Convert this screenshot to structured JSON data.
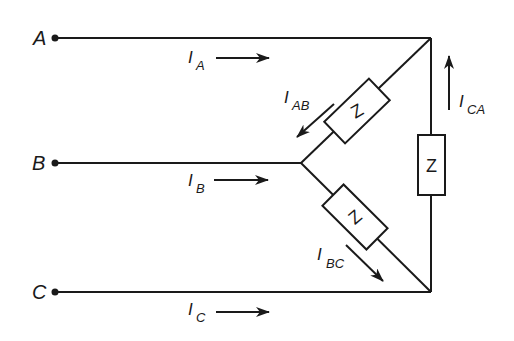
{
  "diagram": {
    "nodes": [
      {
        "id": "A",
        "label": "A"
      },
      {
        "id": "B",
        "label": "B"
      },
      {
        "id": "C",
        "label": "C"
      }
    ],
    "line_currents": [
      {
        "main": "I",
        "sub": "A",
        "direction": "right"
      },
      {
        "main": "I",
        "sub": "B",
        "direction": "right"
      },
      {
        "main": "I",
        "sub": "C",
        "direction": "right"
      }
    ],
    "phase_currents": [
      {
        "main": "I",
        "sub": "AB",
        "direction": "down-left"
      },
      {
        "main": "I",
        "sub": "BC",
        "direction": "down-right"
      },
      {
        "main": "I",
        "sub": "CA",
        "direction": "up"
      }
    ],
    "impedances": [
      {
        "branch": "AB",
        "label": "Z"
      },
      {
        "branch": "BC",
        "label": "Z"
      },
      {
        "branch": "CA",
        "label": "Z"
      }
    ],
    "colors": {
      "line": "#1a1a1a",
      "background": "#ffffff"
    }
  }
}
